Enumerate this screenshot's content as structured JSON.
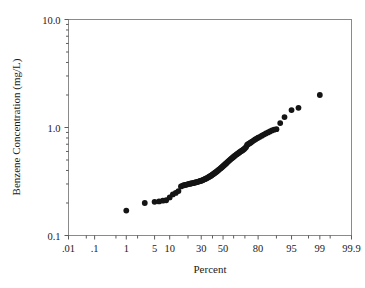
{
  "figure": {
    "type": "probability-plot",
    "background_color": "#ffffff",
    "frame_color": "#8a8a8a",
    "grid_color": "#c9c9c9",
    "point_color": "#141414"
  },
  "axes": {
    "y_title": "Benzene Concentration (mg/L)",
    "x_title": "Percent",
    "y_ticks": [
      "10.0",
      "1.0",
      "0.1"
    ],
    "x_ticks": [
      ".01",
      ".1",
      "1",
      "5",
      "10",
      "30",
      "50",
      "80",
      "95",
      "99",
      "99.9"
    ]
  },
  "chart_data": {
    "type": "scatter",
    "title": "",
    "subtitle": "",
    "xlabel": "Percent",
    "ylabel": "Benzene Concentration (mg/L)",
    "xscale": "probability",
    "yscale": "log",
    "xlim": [
      0.01,
      99.9
    ],
    "ylim": [
      0.1,
      10.0
    ],
    "xticks": [
      0.01,
      0.1,
      1,
      5,
      10,
      30,
      50,
      80,
      95,
      99,
      99.9
    ],
    "xticklabels": [
      ".01",
      ".1",
      "1",
      "5",
      "10",
      "30",
      "50",
      "80",
      "95",
      "99",
      "99.9"
    ],
    "yticks": [
      0.1,
      1.0,
      10.0
    ],
    "yticklabels": [
      "0.1",
      "1.0",
      "10.0"
    ],
    "grid": true,
    "grid_minor_y": true,
    "legend": null,
    "annotations": [],
    "marker": "circle",
    "marker_size": 4,
    "series": [
      {
        "name": "Benzene Concentration",
        "x": [
          1.0,
          3.0,
          5.0,
          6.2,
          7.4,
          8.6,
          10.0,
          11.4,
          12.8,
          14.2,
          15.6,
          16.6,
          17.4,
          18.2,
          19.0,
          19.8,
          20.6,
          21.4,
          22.2,
          23.0,
          23.8,
          24.6,
          25.4,
          26.2,
          27.0,
          27.8,
          28.6,
          29.4,
          30.2,
          31.0,
          31.8,
          32.6,
          33.4,
          34.2,
          35.0,
          35.8,
          36.6,
          37.4,
          38.2,
          39.0,
          39.8,
          40.6,
          41.4,
          42.2,
          43.0,
          43.8,
          44.6,
          45.4,
          46.2,
          47.0,
          47.8,
          48.6,
          49.4,
          50.2,
          51.0,
          51.8,
          52.6,
          53.4,
          54.2,
          55.0,
          55.8,
          56.6,
          57.4,
          58.2,
          59.0,
          59.8,
          60.6,
          61.4,
          62.2,
          63.0,
          63.8,
          64.6,
          65.4,
          66.2,
          67.0,
          67.8,
          68.6,
          69.4,
          70.2,
          71.0,
          71.8,
          72.6,
          73.4,
          74.2,
          75.0,
          76.0,
          77.0,
          78.0,
          79.0,
          80.0,
          81.2,
          82.4,
          83.6,
          84.8,
          86.0,
          87.0,
          88.0,
          89.0,
          90.0,
          91.5,
          93.0,
          95.0,
          96.5,
          99.0
        ],
        "y": [
          0.17,
          0.2,
          0.205,
          0.207,
          0.21,
          0.212,
          0.225,
          0.24,
          0.248,
          0.258,
          0.285,
          0.29,
          0.292,
          0.294,
          0.296,
          0.298,
          0.3,
          0.302,
          0.303,
          0.305,
          0.306,
          0.308,
          0.31,
          0.312,
          0.314,
          0.316,
          0.318,
          0.32,
          0.322,
          0.325,
          0.328,
          0.331,
          0.334,
          0.337,
          0.34,
          0.344,
          0.348,
          0.352,
          0.356,
          0.36,
          0.365,
          0.37,
          0.375,
          0.38,
          0.385,
          0.39,
          0.396,
          0.402,
          0.408,
          0.414,
          0.42,
          0.427,
          0.434,
          0.441,
          0.448,
          0.455,
          0.462,
          0.47,
          0.478,
          0.486,
          0.494,
          0.502,
          0.51,
          0.518,
          0.526,
          0.534,
          0.542,
          0.55,
          0.558,
          0.566,
          0.574,
          0.582,
          0.59,
          0.598,
          0.606,
          0.614,
          0.622,
          0.632,
          0.645,
          0.66,
          0.69,
          0.7,
          0.71,
          0.72,
          0.73,
          0.745,
          0.76,
          0.775,
          0.79,
          0.805,
          0.82,
          0.84,
          0.86,
          0.88,
          0.9,
          0.92,
          0.94,
          0.955,
          0.965,
          1.1,
          1.25,
          1.45,
          1.52,
          2.0
        ]
      }
    ]
  }
}
